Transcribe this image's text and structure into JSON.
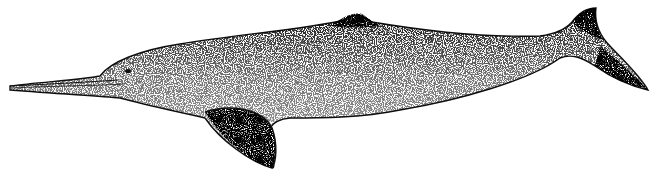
{
  "image": {
    "subject": "river dolphin",
    "style": "stipple illustration",
    "background": "#ffffff",
    "ink": "#111111"
  }
}
